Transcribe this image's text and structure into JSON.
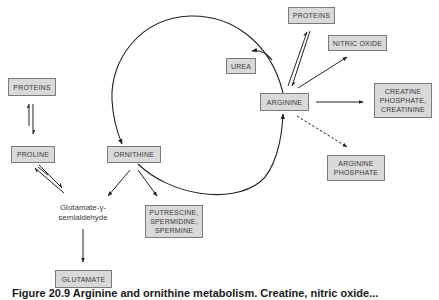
{
  "diagram": {
    "nodes": {
      "proteins_left": "PROTEINS",
      "proline": "PROLINE",
      "ornithine": "ORNITHINE",
      "glutamate_semialdehyde": "Glutamate-γ-\nsemialdehyde",
      "putrescine": "PUTRESCINE,\nSPERMIDINE,\nSPERMINE",
      "glutamate": "GLUTAMATE",
      "urea": "UREA",
      "arginine": "ARGININE",
      "proteins_right": "PROTEINS",
      "nitric_oxide": "NITRIC OXIDE",
      "creatine": "CREATINE\nPHOSPHATE,\nCREATININE",
      "arginine_phosphate": "ARGININE\nPHOSPHATE"
    },
    "edges": [
      {
        "from": "PROTEINS",
        "to": "PROLINE",
        "type": "reversible"
      },
      {
        "from": "PROLINE",
        "to": "Glutamate-γ-semialdehyde",
        "type": "reversible"
      },
      {
        "from": "ORNITHINE",
        "to": "Glutamate-γ-semialdehyde",
        "type": "arrow"
      },
      {
        "from": "ORNITHINE",
        "to": "PUTRESCINE, SPERMIDINE, SPERMINE",
        "type": "arrow"
      },
      {
        "from": "Glutamate-γ-semialdehyde",
        "to": "GLUTAMATE",
        "type": "arrow"
      },
      {
        "from": "ORNITHINE",
        "to": "ARGININE",
        "type": "cycle-arc"
      },
      {
        "from": "ARGININE",
        "to": "ORNITHINE",
        "type": "cycle-arc"
      },
      {
        "from": "cycle",
        "to": "UREA",
        "type": "arrow"
      },
      {
        "from": "ARGININE",
        "to": "PROTEINS",
        "type": "reversible"
      },
      {
        "from": "ARGININE",
        "to": "NITRIC OXIDE",
        "type": "arrow"
      },
      {
        "from": "ARGININE",
        "to": "CREATINE PHOSPHATE, CREATININE",
        "type": "arrow"
      },
      {
        "from": "ARGININE",
        "to": "ARGININE PHOSPHATE",
        "type": "dashed-arrow"
      }
    ]
  },
  "caption": "Figure 20.9 Arginine and ornithine metabolism. Creatine, nitric oxide..."
}
